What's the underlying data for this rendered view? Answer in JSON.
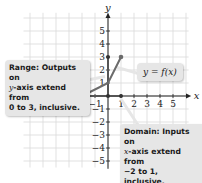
{
  "chart_data": {
    "type": "line",
    "title": "",
    "xlabel": "x",
    "ylabel": "y",
    "xlim": [
      -5,
      5
    ],
    "ylim": [
      -5,
      5
    ],
    "grid": true,
    "x_ticks": [
      -5,
      -4,
      -3,
      -2,
      -1,
      1,
      2,
      3,
      4,
      5
    ],
    "y_ticks": [
      -5,
      -4,
      -3,
      -2,
      -1,
      1,
      2,
      3,
      4,
      5
    ],
    "series": [
      {
        "name": "y = f(x)",
        "points": [
          [
            -2,
            0
          ],
          [
            0,
            1
          ],
          [
            1,
            3
          ]
        ],
        "color": "#6b6b6b",
        "endpoints_closed": true
      }
    ],
    "highlights": {
      "domain": {
        "axis": "x",
        "from": -2,
        "to": 1,
        "inclusive": true
      },
      "range": {
        "axis": "y",
        "from": 0,
        "to": 3,
        "inclusive": true
      }
    },
    "annotations": [
      {
        "id": "range",
        "text": "Range: Outputs on y-axis extend from 0 to 3, inclusive."
      },
      {
        "id": "domain",
        "text": "Domain: Inputs on x-axis extend from −2 to 1, inclusive."
      },
      {
        "id": "function",
        "text": "y = f(x)"
      }
    ]
  },
  "labels": {
    "x_axis": "x",
    "y_axis": "y",
    "function": "y = f(x)",
    "range_line1": "Range: Outputs on",
    "range_line2_var": "y",
    "range_line2_rest": "-axis extend from",
    "range_line3": "0 to 3, inclusive.",
    "domain_line1": "Domain: Inputs on",
    "domain_line2_var": "x",
    "domain_line2_rest": "-axis extend from",
    "domain_line3": "−2 to 1, inclusive."
  },
  "colors": {
    "grid": "#d9d9d9",
    "axis": "#222222",
    "curve": "#6b6b6b",
    "callout_bg": "#e6e6e6"
  }
}
